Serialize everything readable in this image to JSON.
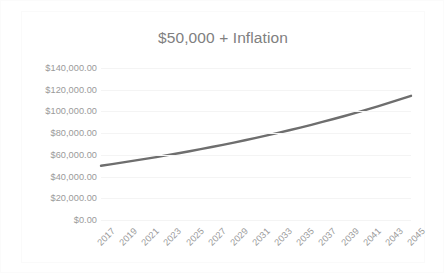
{
  "chart_data": {
    "type": "line",
    "title": "$50,000 + Inflation",
    "xlabel": "",
    "ylabel": "",
    "grid": true,
    "legend": false,
    "legend_position": "none",
    "line_color": "#6e6e6e",
    "gridline_color": "#f4f4f4",
    "tick_label_color": "#9a9a9a",
    "title_color": "#808080",
    "x_tick_rotation_deg": -45,
    "xlim": [
      2017,
      2045
    ],
    "ylim": [
      0,
      140000
    ],
    "y_tick_step": 20000,
    "x_tick_step": 2,
    "x_tick_labels": [
      "2017",
      "2019",
      "2021",
      "2023",
      "2025",
      "2027",
      "2029",
      "2031",
      "2033",
      "2035",
      "2037",
      "2039",
      "2041",
      "2043",
      "2045"
    ],
    "y_tick_labels": [
      "$140,000.00",
      "$120,000.00",
      "$100,000.00",
      "$80,000.00",
      "$60,000.00",
      "$40,000.00",
      "$20,000.00",
      "$0.00"
    ],
    "y_tick_values": [
      140000,
      120000,
      100000,
      80000,
      60000,
      40000,
      20000,
      0
    ],
    "series": [
      {
        "name": "$50,000 + Inflation",
        "x": [
          2017,
          2018,
          2019,
          2020,
          2021,
          2022,
          2023,
          2024,
          2025,
          2026,
          2027,
          2028,
          2029,
          2030,
          2031,
          2032,
          2033,
          2034,
          2035,
          2036,
          2037,
          2038,
          2039,
          2040,
          2041,
          2042,
          2043,
          2044,
          2045
        ],
        "values": [
          50000,
          51500,
          53045,
          54636,
          56275,
          57964,
          59703,
          61494,
          63339,
          65239,
          67196,
          69212,
          71288,
          73427,
          75630,
          77899,
          80236,
          82643,
          85122,
          87676,
          90306,
          93015,
          95806,
          98680,
          101640,
          104689,
          107830,
          111065,
          114397
        ]
      }
    ]
  }
}
